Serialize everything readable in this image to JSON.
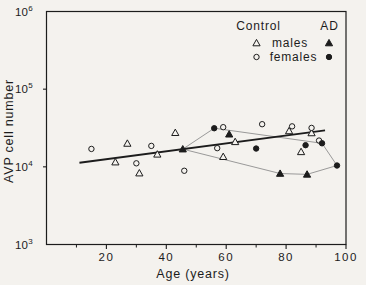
{
  "colors": {
    "ink": "#1c1c1c",
    "ad_outline_line": "#8f8f8f",
    "paper": "#f4f2ee"
  },
  "chart_data": {
    "type": "scatter",
    "title": "",
    "xlabel": "Age (years)",
    "ylabel": "AVP cell number",
    "x_axis": {
      "lim": [
        0,
        100
      ],
      "major_ticks": [
        20,
        40,
        60,
        80,
        100
      ],
      "minor_ticks": [
        10,
        30,
        50,
        70,
        90
      ],
      "tick_labels": [
        "20",
        "40",
        "60",
        "80",
        "100"
      ]
    },
    "y_axis": {
      "scale": "log",
      "lim": [
        1000,
        1000000
      ],
      "tick_exponents": [
        3,
        4,
        5,
        6
      ],
      "base_label": "10"
    },
    "legend": {
      "columns": [
        "Control",
        "AD"
      ],
      "rows": [
        {
          "label": "males",
          "control_marker": "open-triangle",
          "ad_marker": "filled-triangle"
        },
        {
          "label": "females",
          "control_marker": "open-circle",
          "ad_marker": "filled-circle"
        }
      ]
    },
    "series": [
      {
        "name": "Control males",
        "group": "Control",
        "marker": "open-triangle",
        "points": [
          [
            23,
            11500
          ],
          [
            27,
            20000
          ],
          [
            31,
            8300
          ],
          [
            37,
            14500
          ],
          [
            43,
            27500
          ],
          [
            59,
            13500
          ],
          [
            63,
            21000
          ],
          [
            81,
            29000
          ],
          [
            85,
            15600
          ],
          [
            88.5,
            27300
          ]
        ]
      },
      {
        "name": "Control females",
        "group": "Control",
        "marker": "open-circle",
        "points": [
          [
            15,
            17000
          ],
          [
            30,
            11100
          ],
          [
            35,
            18600
          ],
          [
            46,
            8900
          ],
          [
            57,
            17400
          ],
          [
            59,
            32400
          ],
          [
            72,
            35400
          ],
          [
            82,
            33200
          ],
          [
            88.5,
            31700
          ],
          [
            91,
            21800
          ]
        ]
      },
      {
        "name": "AD males",
        "group": "AD",
        "marker": "filled-triangle",
        "points": [
          [
            45.5,
            16900
          ],
          [
            61,
            26300
          ],
          [
            78,
            8200
          ],
          [
            87,
            8000
          ]
        ]
      },
      {
        "name": "AD females",
        "group": "AD",
        "marker": "filled-circle",
        "points": [
          [
            56,
            31400
          ],
          [
            70,
            17200
          ],
          [
            86.5,
            19000
          ],
          [
            92,
            20100
          ],
          [
            97,
            10400
          ]
        ]
      }
    ],
    "regression_line": {
      "x1": 11,
      "y1": 11300,
      "x2": 93,
      "y2": 29500
    },
    "ad_outline": [
      [
        45.5,
        16900
      ],
      [
        56,
        31400
      ],
      [
        92,
        20100
      ],
      [
        97,
        10400
      ],
      [
        87,
        8000
      ],
      [
        78,
        8200
      ]
    ]
  }
}
